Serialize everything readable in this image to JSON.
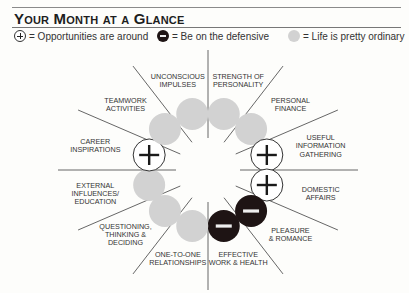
{
  "title": "Your Month at a Glance",
  "legend": [
    {
      "icon": "plus-circle-icon",
      "label": "= Opportunities are around"
    },
    {
      "icon": "minus-circle-icon",
      "label": "= Be on the defensive"
    },
    {
      "icon": "grey-circle-icon",
      "label": "= Life is pretty ordinary"
    }
  ],
  "colors": {
    "ordinary": "#d2d2d2",
    "defensive": "#1e1414",
    "opportunity": "#ffffff",
    "line": "#555555"
  },
  "sectors": [
    {
      "label": "Strength of\nPersonality",
      "status": "ordinary"
    },
    {
      "label": "Personal\nFinance",
      "status": "ordinary"
    },
    {
      "label": "Useful\nInformation\nGathering",
      "status": "opportunity"
    },
    {
      "label": "Domestic\nAffairs",
      "status": "opportunity"
    },
    {
      "label": "Pleasure\n& Romance",
      "status": "defensive"
    },
    {
      "label": "Effective\nWork & Health",
      "status": "defensive"
    },
    {
      "label": "One-to-One\nRelationships",
      "status": "ordinary"
    },
    {
      "label": "Questioning,\nThinking &\nDeciding",
      "status": "ordinary"
    },
    {
      "label": "External\nInfluences/\nEducation",
      "status": "ordinary"
    },
    {
      "label": "Career\nInspirations",
      "status": "opportunity"
    },
    {
      "label": "Teamwork\nActivities",
      "status": "ordinary"
    },
    {
      "label": "Unconscious\nImpulses",
      "status": "ordinary"
    }
  ]
}
